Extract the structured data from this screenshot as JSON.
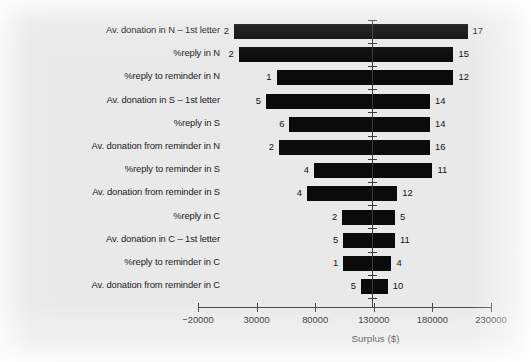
{
  "chart_data": {
    "type": "bar",
    "subtype": "tornado",
    "title": "",
    "xlabel": "Surplus ($)",
    "ylabel": "",
    "xlim": [
      -20000,
      230000
    ],
    "xticks": [
      -20000,
      30000,
      80000,
      130000,
      180000,
      230000
    ],
    "xticklabels": [
      "−20000",
      "30000",
      "80000",
      "130000",
      "180000",
      "230000"
    ],
    "grid": false,
    "legend": null,
    "baseline": 130000,
    "categories": [
      "Av. donation in N – 1st letter",
      "%reply in N",
      "%reply to reminder in N",
      "Av. donation in S – 1st letter",
      "%reply in S",
      "Av. donation from reminder in N",
      "%reply to reminder in S",
      "Av. donation from reminder in S",
      "%reply in C",
      "Av. donation in C – 1st letter",
      "%reply to reminder in C",
      "Av. donation from reminder in C"
    ],
    "bars": [
      {
        "category": "Av. donation in N – 1st letter",
        "low_label": "2",
        "high_label": "17",
        "low": 10600,
        "high": 210000
      },
      {
        "category": "%reply in N",
        "low_label": "2",
        "high_label": "15",
        "low": 14800,
        "high": 198000
      },
      {
        "category": "%reply to reminder in N",
        "low_label": "1",
        "high_label": "12",
        "low": 47000,
        "high": 198000
      },
      {
        "category": "Av. donation in S – 1st letter",
        "low_label": "5",
        "high_label": "14",
        "low": 38000,
        "high": 178000
      },
      {
        "category": "%reply in S",
        "low_label": "6",
        "high_label": "14",
        "low": 58000,
        "high": 178000
      },
      {
        "category": "Av. donation from reminder in N",
        "low_label": "2",
        "high_label": "16",
        "low": 49000,
        "high": 178000
      },
      {
        "category": "%reply to reminder in S",
        "low_label": "4",
        "high_label": "11",
        "low": 79000,
        "high": 180000
      },
      {
        "category": "Av. donation from reminder in S",
        "low_label": "4",
        "high_label": "12",
        "low": 73000,
        "high": 150000
      },
      {
        "category": "%reply in C",
        "low_label": "2",
        "high_label": "5",
        "low": 103000,
        "high": 148000
      },
      {
        "category": "Av. donation in C – 1st letter",
        "low_label": "5",
        "high_label": "11",
        "low": 104000,
        "high": 148000
      },
      {
        "category": "%reply to reminder in C",
        "low_label": "1",
        "high_label": "4",
        "low": 104000,
        "high": 145000
      },
      {
        "category": "Av. donation from reminder in C",
        "low_label": "5",
        "high_label": "10",
        "low": 119000,
        "high": 142000
      }
    ]
  }
}
